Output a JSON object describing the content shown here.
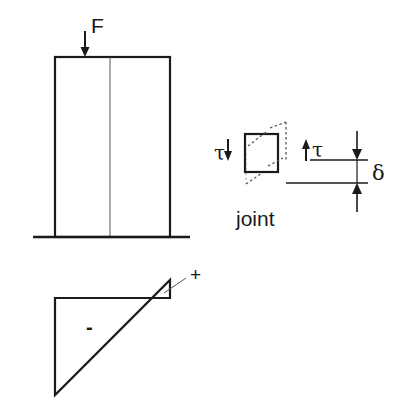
{
  "labels": {
    "force": "F",
    "tau_left": "τ",
    "tau_right": "τ",
    "delta": "δ",
    "joint": "joint",
    "plus": "+",
    "minus": "-"
  },
  "colors": {
    "stroke": "#1a1a1a",
    "thin_stroke": "#555555",
    "background": "#ffffff"
  }
}
